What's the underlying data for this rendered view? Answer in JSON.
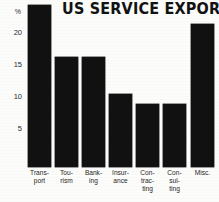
{
  "chart_data": {
    "type": "bar",
    "title": "US SERVICE EXPORT",
    "xlabel": "",
    "ylabel": "%",
    "ylim": [
      0,
      22.5
    ],
    "yticks": [
      5,
      10,
      15,
      20
    ],
    "ytick_labels": [
      "5",
      "10",
      "15",
      "20"
    ],
    "grid": false,
    "legend": false,
    "categories": [
      "Trans-\nport",
      "Tou-\nrism",
      "Bank-\ning",
      "Insur-\nance",
      "Con-\ntrac-\nting",
      "Con-\nsul-\nting",
      "Misc."
    ],
    "category_plain": [
      "Transport",
      "Tourism",
      "Banking",
      "Insurance",
      "Contracting",
      "Consulting",
      "Misc."
    ],
    "values": [
      21.8,
      14.8,
      14.8,
      9.9,
      8.5,
      8.5,
      19.3
    ],
    "bar_color": "#111111",
    "background_color": "#fcfcfa"
  },
  "yticks": {
    "t0": "20",
    "t1": "15",
    "t2": "10",
    "t3": "5",
    "unit": "%"
  },
  "xlabels": {
    "l0": "Trans-\nport",
    "l1": "Tou-\nrism",
    "l2": "Bank-\ning",
    "l3": "Insur-\nance",
    "l4": "Con-\ntrac-\nting",
    "l5": "Con-\nsul-\nting",
    "l6": "Misc."
  },
  "title": "US SERVICE EXPORT"
}
